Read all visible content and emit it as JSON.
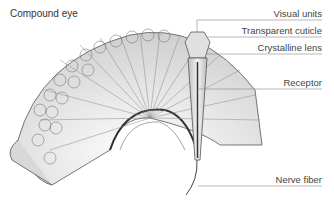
{
  "diagram": {
    "title": "Compound eye",
    "labels": [
      {
        "id": "visual-units",
        "text": "Visual units",
        "y": 12
      },
      {
        "id": "transparent-cuticle",
        "text": "Transparent cuticle",
        "y": 30
      },
      {
        "id": "crystalline-lens",
        "text": "Crystalline lens",
        "y": 48
      },
      {
        "id": "receptor",
        "text": "Receptor",
        "y": 82
      },
      {
        "id": "nerve-fiber",
        "text": "Nerve fiber",
        "y": 179
      }
    ],
    "colors": {
      "line": "#777777",
      "fill": "#e6e6e6",
      "stroke": "#555555"
    }
  }
}
